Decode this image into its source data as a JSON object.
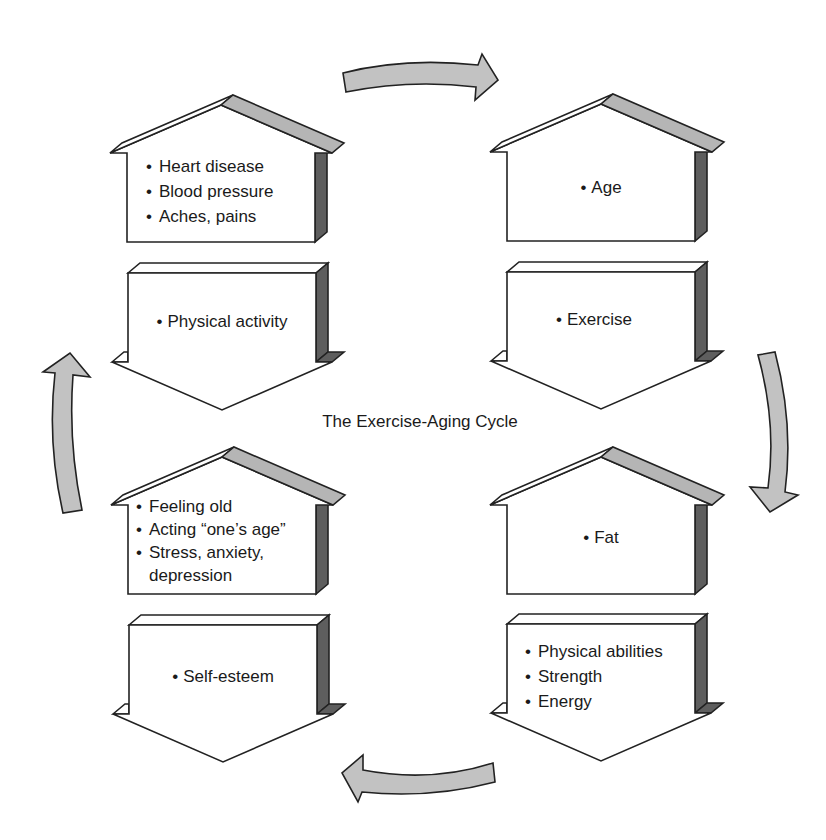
{
  "diagram": {
    "title": "The Exercise-Aging Cycle",
    "bullet": "•",
    "stages": [
      {
        "position": "top-left-upper",
        "shape": "house",
        "direction": "up",
        "items": [
          "Heart disease",
          "Blood pressure",
          "Aches, pains"
        ]
      },
      {
        "position": "top-left-lower",
        "shape": "down-arrow",
        "direction": "down",
        "items": [
          "Physical activity"
        ]
      },
      {
        "position": "top-right-upper",
        "shape": "house",
        "direction": "up",
        "items": [
          "Age"
        ]
      },
      {
        "position": "top-right-lower",
        "shape": "down-arrow",
        "direction": "down",
        "items": [
          "Exercise"
        ]
      },
      {
        "position": "bottom-right-upper",
        "shape": "house",
        "direction": "up",
        "items": [
          "Fat"
        ]
      },
      {
        "position": "bottom-right-lower",
        "shape": "down-arrow",
        "direction": "down",
        "items": [
          "Physical abilities",
          "Strength",
          "Energy"
        ]
      },
      {
        "position": "bottom-left-upper",
        "shape": "house",
        "direction": "up",
        "items": [
          "Feeling old",
          "Acting “one’s age”",
          "Stress, anxiety, depression"
        ]
      },
      {
        "position": "bottom-left-lower",
        "shape": "down-arrow",
        "direction": "down",
        "items": [
          "Self-esteem"
        ]
      }
    ],
    "cycle_arrows": [
      {
        "position": "top",
        "icon": "curved-arrow-right-icon"
      },
      {
        "position": "right",
        "icon": "curved-arrow-down-icon"
      },
      {
        "position": "bottom",
        "icon": "curved-arrow-left-icon"
      },
      {
        "position": "left",
        "icon": "curved-arrow-up-icon"
      }
    ],
    "colors": {
      "outline": "#222222",
      "roof": "#b5b5b5",
      "side": "#5e5e5e",
      "arrow": "#c2c2c2",
      "face": "#ffffff",
      "text": "#1a1a1a",
      "bg": "#ffffff"
    }
  }
}
